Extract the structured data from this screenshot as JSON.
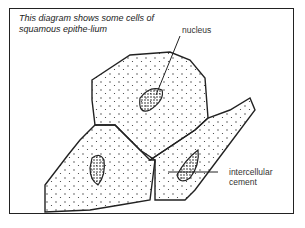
{
  "caption": "This diagram shows some cells of squamous epithe-lium",
  "labels": {
    "nucleus": "nucleus",
    "intercellular_cement": "intercellular cement"
  },
  "colors": {
    "stroke": "#222222",
    "background": "#ffffff"
  }
}
